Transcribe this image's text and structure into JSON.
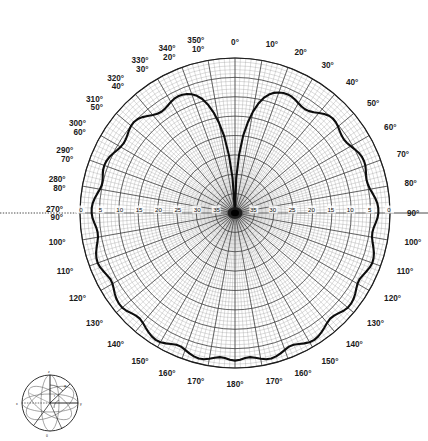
{
  "figure": {
    "name": "polar-radiation-pattern",
    "type": "polar-plot",
    "background_color": "#ffffff",
    "trace_color": "#101010",
    "grid_color": "#4a4a4a",
    "grid_fine_color": "#8c8c8c"
  },
  "chart_data": {
    "type": "line",
    "subtype": "polar",
    "title": "",
    "xlabel": "",
    "ylabel": "",
    "grid": true,
    "legend_position": "none",
    "angular_axis": {
      "label": "",
      "units": "degrees",
      "direction": "clockwise",
      "zero_at": "top",
      "major_step": 10,
      "minor_step": 2,
      "range": [
        0,
        360
      ]
    },
    "radial_axis": {
      "label": "",
      "units": "dB",
      "outer_value": 0,
      "center_value": 40,
      "major_step": 5,
      "minor_step": 1,
      "tick_labels": [
        "0",
        "5",
        "10",
        "15",
        "20",
        "25",
        "30",
        "35"
      ],
      "tick_values": [
        0,
        5,
        10,
        15,
        20,
        25,
        30,
        35
      ],
      "orientation": "outward-decreasing"
    },
    "angular_tick_labels_right": [
      {
        "angle": 0,
        "top": "0°",
        "bottom": ""
      },
      {
        "angle": 10,
        "top": "10°",
        "bottom": ""
      },
      {
        "angle": 20,
        "top": "20°",
        "bottom": ""
      },
      {
        "angle": 30,
        "top": "30°",
        "bottom": ""
      },
      {
        "angle": 40,
        "top": "40°",
        "bottom": ""
      },
      {
        "angle": 50,
        "top": "50°",
        "bottom": ""
      },
      {
        "angle": 60,
        "top": "60°",
        "bottom": ""
      },
      {
        "angle": 70,
        "top": "70°",
        "bottom": ""
      },
      {
        "angle": 80,
        "top": "80°",
        "bottom": ""
      },
      {
        "angle": 90,
        "top": "90°",
        "bottom": ""
      },
      {
        "angle": 100,
        "top": "100°",
        "bottom": ""
      },
      {
        "angle": 110,
        "top": "110°",
        "bottom": ""
      },
      {
        "angle": 120,
        "top": "120°",
        "bottom": ""
      },
      {
        "angle": 130,
        "top": "130°",
        "bottom": ""
      },
      {
        "angle": 140,
        "top": "140°",
        "bottom": ""
      },
      {
        "angle": 150,
        "top": "150°",
        "bottom": ""
      },
      {
        "angle": 160,
        "top": "160°",
        "bottom": ""
      },
      {
        "angle": 170,
        "top": "170°",
        "bottom": ""
      },
      {
        "angle": 180,
        "top": "180°",
        "bottom": ""
      }
    ],
    "angular_tick_labels_left": [
      {
        "angle": 190,
        "top": "170°",
        "bottom": ""
      },
      {
        "angle": 200,
        "top": "160°",
        "bottom": ""
      },
      {
        "angle": 210,
        "top": "150°",
        "bottom": ""
      },
      {
        "angle": 220,
        "top": "140°",
        "bottom": ""
      },
      {
        "angle": 230,
        "top": "130°",
        "bottom": ""
      },
      {
        "angle": 240,
        "top": "120°",
        "bottom": ""
      },
      {
        "angle": 250,
        "top": "110°",
        "bottom": ""
      },
      {
        "angle": 260,
        "top": "100°",
        "bottom": ""
      },
      {
        "angle": 270,
        "top": "270°",
        "bottom": "90°"
      },
      {
        "angle": 280,
        "top": "280°",
        "bottom": "80°"
      },
      {
        "angle": 290,
        "top": "290°",
        "bottom": "70°"
      },
      {
        "angle": 300,
        "top": "300°",
        "bottom": "60°"
      },
      {
        "angle": 310,
        "top": "310°",
        "bottom": "50°"
      },
      {
        "angle": 320,
        "top": "320°",
        "bottom": "40°"
      },
      {
        "angle": 330,
        "top": "330°",
        "bottom": "30°"
      },
      {
        "angle": 340,
        "top": "340°",
        "bottom": "20°"
      },
      {
        "angle": 350,
        "top": "350°",
        "bottom": "10°"
      }
    ],
    "series": [
      {
        "name": "radiation-pattern",
        "units": "dB below peak",
        "angles": [
          0,
          2,
          4,
          6,
          8,
          10,
          12,
          14,
          16,
          18,
          20,
          22,
          24,
          26,
          28,
          30,
          32,
          34,
          36,
          38,
          40,
          42,
          44,
          46,
          48,
          50,
          52,
          54,
          56,
          58,
          60,
          62,
          64,
          66,
          68,
          70,
          72,
          74,
          76,
          78,
          80,
          82,
          84,
          86,
          88,
          90,
          92,
          94,
          96,
          98,
          100,
          102,
          104,
          106,
          108,
          110,
          112,
          114,
          116,
          118,
          120,
          122,
          124,
          126,
          128,
          130,
          132,
          134,
          136,
          138,
          140,
          142,
          144,
          146,
          148,
          150,
          152,
          154,
          156,
          158,
          160,
          162,
          164,
          166,
          168,
          170,
          172,
          174,
          176,
          178,
          180,
          182,
          184,
          186,
          188,
          190,
          192,
          194,
          196,
          198,
          200,
          202,
          204,
          206,
          208,
          210,
          212,
          214,
          216,
          218,
          220,
          222,
          224,
          226,
          228,
          230,
          232,
          234,
          236,
          238,
          240,
          242,
          244,
          246,
          248,
          250,
          252,
          254,
          256,
          258,
          260,
          262,
          264,
          266,
          268,
          270,
          272,
          274,
          276,
          278,
          280,
          282,
          284,
          286,
          288,
          290,
          292,
          294,
          296,
          298,
          300,
          302,
          304,
          306,
          308,
          310,
          312,
          314,
          316,
          318,
          320,
          322,
          324,
          326,
          328,
          330,
          332,
          334,
          336,
          338,
          340,
          342,
          344,
          346,
          348,
          350,
          352,
          354,
          356,
          358,
          360
        ],
        "values_db": [
          40,
          31,
          25,
          20,
          16.5,
          13.5,
          11.2,
          9.4,
          8.2,
          7.4,
          6.9,
          6.6,
          6.5,
          6.6,
          6.9,
          7.3,
          7.6,
          7.7,
          7.5,
          7.0,
          6.3,
          5.6,
          5.1,
          4.9,
          5.0,
          5.3,
          5.7,
          6.0,
          6.1,
          5.9,
          5.5,
          5.0,
          4.5,
          4.2,
          4.1,
          4.2,
          4.5,
          4.8,
          5.0,
          4.9,
          4.6,
          4.1,
          3.6,
          3.2,
          3.0,
          3.0,
          3.2,
          3.6,
          4.0,
          4.2,
          4.1,
          3.7,
          3.2,
          2.7,
          2.4,
          2.3,
          2.5,
          2.9,
          3.3,
          3.6,
          3.5,
          3.1,
          2.6,
          2.2,
          2.0,
          2.0,
          2.3,
          2.8,
          3.2,
          3.3,
          3.0,
          2.5,
          2.0,
          1.6,
          1.4,
          1.5,
          1.9,
          2.4,
          2.8,
          2.8,
          2.4,
          1.9,
          1.5,
          1.3,
          1.4,
          1.8,
          2.3,
          2.6,
          2.5,
          2.1,
          1.9,
          2.1,
          2.5,
          2.6,
          2.3,
          1.8,
          1.4,
          1.3,
          1.5,
          1.9,
          2.4,
          2.8,
          2.8,
          2.4,
          1.9,
          1.5,
          1.4,
          1.6,
          2.0,
          2.5,
          3.0,
          3.3,
          3.2,
          2.8,
          2.3,
          2.0,
          2.0,
          2.2,
          2.6,
          3.1,
          3.5,
          3.6,
          3.3,
          2.9,
          2.5,
          2.3,
          2.4,
          2.7,
          3.2,
          3.7,
          4.1,
          4.2,
          4.0,
          3.6,
          3.2,
          3.0,
          3.0,
          3.2,
          3.6,
          4.1,
          4.6,
          4.9,
          4.8,
          4.5,
          4.2,
          4.1,
          4.2,
          4.5,
          5.0,
          5.5,
          5.9,
          6.1,
          6.0,
          5.7,
          5.3,
          5.0,
          4.9,
          5.1,
          5.6,
          6.3,
          7.0,
          7.5,
          7.7,
          7.6,
          7.3,
          6.9,
          6.6,
          6.5,
          6.6,
          6.9,
          7.4,
          8.2,
          9.4,
          11.2,
          13.5,
          16.5,
          20,
          25,
          31,
          40
        ]
      }
    ],
    "features": {
      "main_null_angle_deg": 0,
      "main_null_depth_db": 40,
      "peak_angle_deg": 180,
      "peak_value_db": 1.3,
      "lobe_count": 2,
      "pattern_symmetry": "mirror about 0-180 axis"
    }
  },
  "inset": {
    "name": "coordinate-sphere-diagram",
    "description": "small spherical coordinate reference globe",
    "labels": [
      "z",
      "x",
      "y",
      "θ",
      "φ",
      "r"
    ]
  }
}
